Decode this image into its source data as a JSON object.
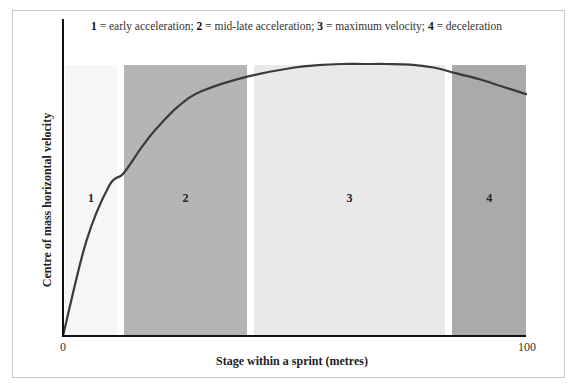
{
  "chart_data": {
    "type": "line",
    "title": "",
    "legend_text": [
      {
        "num": "1",
        "desc": " = early acceleration; "
      },
      {
        "num": "2",
        "desc": " = mid-late acceleration; "
      },
      {
        "num": "3",
        "desc": " = maximum velocity; "
      },
      {
        "num": "4",
        "desc": " = deceleration"
      }
    ],
    "xlabel": "Stage within a sprint (metres)",
    "ylabel": "Centre of mass horizontal velocity",
    "xlim": [
      0,
      100
    ],
    "x_ticks": [
      "0",
      "100"
    ],
    "grid": false,
    "stages": [
      {
        "label": "1",
        "name": "early acceleration",
        "x_start": 0.5,
        "x_end": 11.6,
        "color": "#f6f6f6"
      },
      {
        "label": "2",
        "name": "mid-late acceleration",
        "x_start": 13.2,
        "x_end": 39.7,
        "color": "#b5b5b5"
      },
      {
        "label": "3",
        "name": "maximum velocity",
        "x_start": 41.3,
        "x_end": 82.5,
        "color": "#e9e9e9"
      },
      {
        "label": "4",
        "name": "deceleration",
        "x_start": 84.1,
        "x_end": 100,
        "color": "#aaaaaa"
      }
    ],
    "series": [
      {
        "name": "Centre of mass horizontal velocity",
        "x": [
          0,
          5,
          10,
          13,
          17,
          20,
          25,
          30,
          40,
          50,
          55,
          60,
          65,
          70,
          75,
          80,
          85,
          90,
          95,
          100
        ],
        "y": [
          0,
          32,
          51,
          55,
          64,
          70,
          78,
          83,
          88,
          91,
          91.8,
          92.2,
          92.2,
          92.2,
          92,
          91,
          89,
          87,
          84.5,
          82
        ],
        "y_relative_percent": true
      }
    ],
    "line_color": "#3a3a3a"
  }
}
